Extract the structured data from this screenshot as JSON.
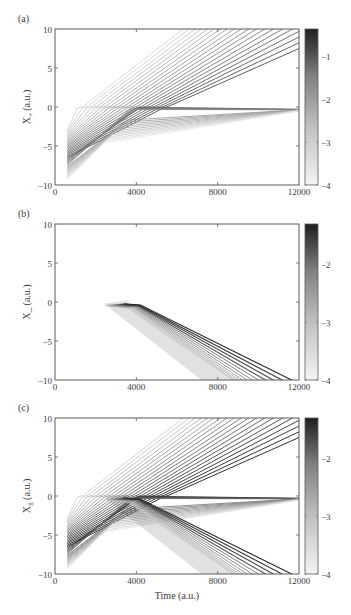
{
  "figure": {
    "xlabel": "Time (a.u.)"
  },
  "chart_data": [
    {
      "type": "line",
      "panel_label": "(a)",
      "ylabel": "X",
      "ylabel_subscript": "+",
      "ylabel_units": "(a.u.)",
      "xlim": [
        0,
        12000
      ],
      "ylim": [
        -10,
        10
      ],
      "xticks": [
        0,
        4000,
        8000,
        12000
      ],
      "xtick_labels": [
        "0",
        "4000",
        "8000",
        "12000"
      ],
      "yticks": [
        -10,
        -5,
        0,
        5,
        10
      ],
      "ytick_labels": [
        "−10",
        "−5",
        "0",
        "5",
        "10"
      ],
      "colorbar": {
        "range": [
          -4,
          -0.35
        ],
        "ticks": [
          -1,
          -2,
          -3,
          -4
        ],
        "tick_labels": [
          "−1",
          "−2",
          "−3",
          "−4"
        ],
        "colormap": "gray_reversed"
      },
      "description": "Fan of trajectories starting at t=600 between x=-9 and x=-3; upper group crosses 0 and rises linearly to the top-right boundary (dark), lower group converges toward x≈-0.3 at t=12000 (light).",
      "families": [
        {
          "name": "escaping-up",
          "count": 20,
          "t_start": 600,
          "x_start_range": [
            -3.0,
            -6.5
          ],
          "t_turn_range": [
            1500,
            5500
          ],
          "x_end_at_12000_range": [
            22,
            7.5
          ],
          "intensity_range": [
            -3.6,
            -1.2
          ]
        },
        {
          "name": "converging",
          "count": 18,
          "t_start": 600,
          "x_start_range": [
            -6.7,
            -9.3
          ],
          "x_end_at_12000": -0.3,
          "intensity_range": [
            -1.6,
            -3.8
          ]
        }
      ]
    },
    {
      "type": "line",
      "panel_label": "(b)",
      "ylabel": "X_",
      "ylabel_subscript": "",
      "ylabel_units": "(a.u.)",
      "xlim": [
        0,
        12000
      ],
      "ylim": [
        -10,
        10
      ],
      "xticks": [
        0,
        4000,
        8000,
        12000
      ],
      "xtick_labels": [
        "0",
        "4000",
        "8000",
        "12000"
      ],
      "yticks": [
        -10,
        -5,
        0,
        5,
        10
      ],
      "ytick_labels": [
        "−10",
        "−5",
        "0",
        "5",
        "10"
      ],
      "colorbar": {
        "range": [
          -4,
          -1.3
        ],
        "ticks": [
          -2,
          -3,
          -4
        ],
        "tick_labels": [
          "−2",
          "−3",
          "−4"
        ],
        "colormap": "gray_reversed"
      },
      "description": "Trajectories appear near t=2400, x≈-0.2, cluster around t≈3600, then descend linearly reaching x=-10 between t≈8800 and t≈11800.",
      "families": [
        {
          "name": "descending",
          "count": 14,
          "t_start": 2400,
          "x_start": -0.2,
          "t_cluster": 3600,
          "t_at_bottom_range": [
            8800,
            11800
          ],
          "intensity_range": [
            -3.8,
            -1.5
          ]
        }
      ]
    },
    {
      "type": "line",
      "panel_label": "(c)",
      "ylabel": "X",
      "ylabel_subscript": "±",
      "ylabel_units": "(a.u.)",
      "xlim": [
        0,
        12000
      ],
      "ylim": [
        -10,
        10
      ],
      "xticks": [
        0,
        4000,
        8000,
        12000
      ],
      "xtick_labels": [
        "0",
        "4000",
        "8000",
        "12000"
      ],
      "yticks": [
        -10,
        -5,
        0,
        5,
        10
      ],
      "ytick_labels": [
        "−10",
        "−5",
        "0",
        "5",
        "10"
      ],
      "colorbar": {
        "range": [
          -4,
          -1.3
        ],
        "ticks": [
          -2,
          -3,
          -4
        ],
        "tick_labels": [
          "−2",
          "−3",
          "−4"
        ],
        "colormap": "gray_reversed"
      },
      "description": "Superposition of panels (a) and (b): rising fan, converging fan toward x≈-0.3, and descending branch from t≈3600 reaching x=-10 near t=9000-11800."
    }
  ]
}
